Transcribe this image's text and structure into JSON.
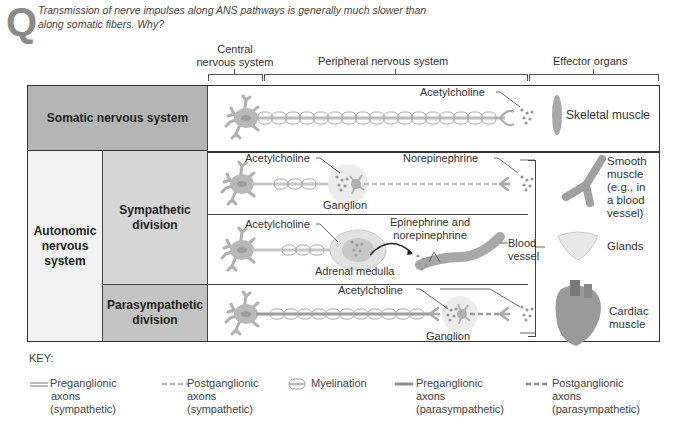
{
  "question": {
    "icon": "Q",
    "text_line1": "Transmission of nerve impulses along ANS pathways is generally much slower than",
    "text_line2": "along somatic fibers. Why?"
  },
  "headers": {
    "cns_line1": "Central",
    "cns_line2": "nervous system",
    "pns": "Peripheral nervous system",
    "effector": "Effector organs"
  },
  "rows": {
    "somatic": {
      "label": "Somatic nervous system",
      "neurotransmitter": "Acetylcholine",
      "effector": "Skeletal muscle"
    },
    "autonomic": {
      "line1": "Autonomic",
      "line2": "nervous",
      "line3": "system"
    },
    "sympathetic": {
      "line1": "Sympathetic",
      "line2": "division",
      "pathway1": {
        "pre_nt": "Acetylcholine",
        "ganglion": "Ganglion",
        "post_nt": "Norepinephrine"
      },
      "pathway2": {
        "pre_nt": "Acetylcholine",
        "organ": "Adrenal medulla",
        "hormone_line1": "Epinephrine and",
        "hormone_line2": "norepinephrine",
        "target_line1": "Blood",
        "target_line2": "vessel"
      }
    },
    "parasympathetic": {
      "line1": "Parasympathetic",
      "line2": "division",
      "pre_nt": "Acetylcholine",
      "ganglion": "Ganglion"
    }
  },
  "effectors": {
    "smooth": [
      "Smooth",
      "muscle",
      "(e.g., in",
      "a blood",
      "vessel)"
    ],
    "glands": "Glands",
    "cardiac": [
      "Cardiac",
      "muscle"
    ]
  },
  "key": {
    "title": "KEY:",
    "items": [
      {
        "icon": "solid-light-line",
        "lines": [
          "Preganglionic",
          "axons",
          "(sympathetic)"
        ]
      },
      {
        "icon": "dashed-light-line",
        "lines": [
          "Postganglionic",
          "axons",
          "(sympathetic)"
        ]
      },
      {
        "icon": "myelination-sheath",
        "lines": [
          "Myelination"
        ]
      },
      {
        "icon": "solid-dark-line",
        "lines": [
          "Preganglionic",
          "axons",
          "(parasympathetic)"
        ]
      },
      {
        "icon": "dashed-dark-line",
        "lines": [
          "Postganglionic",
          "axons",
          "(parasympathetic)"
        ]
      }
    ]
  },
  "colors": {
    "somatic_bg": "#b5b5b5",
    "sympathetic_bg": "#d6d6d6",
    "parasympathetic_bg": "#c4c4c4",
    "autonomic_bg": "#f2f2f2",
    "neuron": "#b8b8b8",
    "axon_light": "#c8c8c8",
    "axon_dark": "#8a8a8a"
  }
}
